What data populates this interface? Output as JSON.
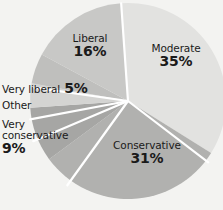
{
  "chart_data": {
    "type": "pie",
    "title": "",
    "subtitle": "",
    "xlabel": "",
    "ylabel": "",
    "legend_position": "none",
    "grid": false,
    "units": "percent",
    "categories": [
      "Moderate",
      "Conservative",
      "Very conservative",
      "Other",
      "Very liberal",
      "Liberal"
    ],
    "values": [
      35,
      31,
      9,
      4,
      5,
      16
    ],
    "labels": [
      "35%",
      "31%",
      "9%",
      "",
      "5%",
      "16%"
    ],
    "colors": [
      "#e2e2e0",
      "#b1b1af",
      "#a6a6a4",
      "#d4d4d2",
      "#bfbfbd",
      "#c8c8c6"
    ],
    "slice_label_style": "inside-and-outside",
    "start_angle_deg": 356,
    "direction": "clockwise",
    "center": {
      "x": 128,
      "y": 101
    },
    "radius": 98,
    "separator_color": "#ffffff"
  },
  "slices": {
    "moderate": {
      "name": "Moderate",
      "pct": "35%"
    },
    "conservative": {
      "name": "Conservative",
      "pct": "31%"
    },
    "very_conservative": {
      "name": "Very\nconservative",
      "name_line1": "Very",
      "name_line2": "conservative",
      "pct": "9%"
    },
    "other": {
      "name": "Other",
      "pct": ""
    },
    "very_liberal": {
      "name": "Very liberal",
      "pct": "5%"
    },
    "liberal": {
      "name": "Liberal",
      "pct": "16%"
    }
  }
}
